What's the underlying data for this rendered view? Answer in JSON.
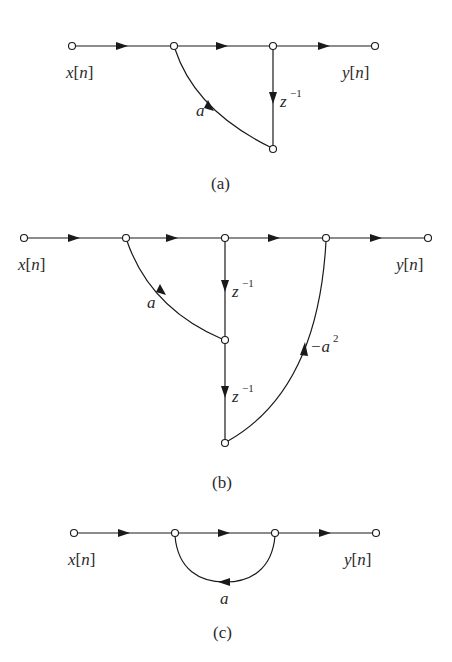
{
  "diagrams": [
    {
      "id": "a",
      "caption": "(a)",
      "input_label": "x[n]",
      "output_label": "y[n]",
      "input_label_parts": {
        "var": "x",
        "open": "[",
        "idx": "n",
        "close": "]"
      },
      "output_label_parts": {
        "var": "y",
        "open": "[",
        "idx": "n",
        "close": "]"
      },
      "branches": [
        {
          "from": "in",
          "to": "n1",
          "gain": "1"
        },
        {
          "from": "n1",
          "to": "n2",
          "gain": "1"
        },
        {
          "from": "n2",
          "to": "out",
          "gain": "1"
        },
        {
          "from": "n2",
          "to": "n3",
          "gain": "z^-1",
          "label_base": "z",
          "label_exp": "−1"
        },
        {
          "from": "n3",
          "to": "n1",
          "gain": "a",
          "label": "a"
        }
      ]
    },
    {
      "id": "b",
      "caption": "(b)",
      "input_label": "x[n]",
      "output_label": "y[n]",
      "input_label_parts": {
        "var": "x",
        "open": "[",
        "idx": "n",
        "close": "]"
      },
      "output_label_parts": {
        "var": "y",
        "open": "[",
        "idx": "n",
        "close": "]"
      },
      "branches": [
        {
          "from": "in",
          "to": "n1",
          "gain": "1"
        },
        {
          "from": "n1",
          "to": "n2",
          "gain": "1"
        },
        {
          "from": "n2",
          "to": "n3",
          "gain": "1"
        },
        {
          "from": "n3",
          "to": "out",
          "gain": "1"
        },
        {
          "from": "n2",
          "to": "n4",
          "gain": "z^-1",
          "label_base": "z",
          "label_exp": "−1"
        },
        {
          "from": "n4",
          "to": "n1",
          "gain": "a",
          "label": "a"
        },
        {
          "from": "n4",
          "to": "n5",
          "gain": "z^-1",
          "label_base": "z",
          "label_exp": "−1"
        },
        {
          "from": "n5",
          "to": "n3",
          "gain": "-a^2",
          "label_base": "−a",
          "label_exp": "2"
        }
      ]
    },
    {
      "id": "c",
      "caption": "(c)",
      "input_label": "x[n]",
      "output_label": "y[n]",
      "input_label_parts": {
        "var": "x",
        "open": "[",
        "idx": "n",
        "close": "]"
      },
      "output_label_parts": {
        "var": "y",
        "open": "[",
        "idx": "n",
        "close": "]"
      },
      "branches": [
        {
          "from": "in",
          "to": "n1",
          "gain": "1"
        },
        {
          "from": "n1",
          "to": "n2",
          "gain": "1"
        },
        {
          "from": "n2",
          "to": "out",
          "gain": "1"
        },
        {
          "from": "n2",
          "to": "n1",
          "gain": "a",
          "label": "a"
        }
      ]
    }
  ]
}
